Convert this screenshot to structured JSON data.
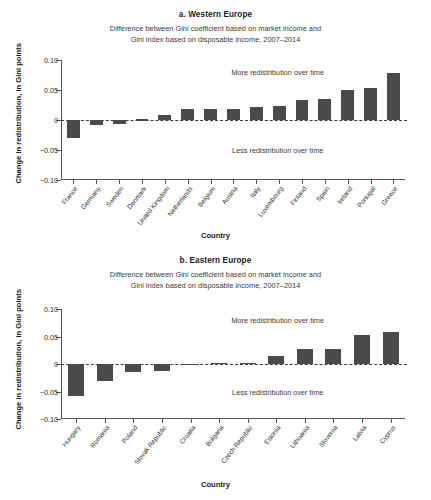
{
  "figure": {
    "background": "#ffffff",
    "bar_color": "#4a4a4a",
    "axis_color": "#555555"
  },
  "panel_a": {
    "title": "a. Western Europe",
    "subtitle_line1": "Difference between Gini coefficient based on market income and",
    "subtitle_line2": "Gini index based on disposable income, 2007–2014",
    "xlabel": "Country",
    "ylabel": "Change in redistribution, in Gini points",
    "annotation_above": "More redistribution over time",
    "annotation_below": "Less redistribution over time",
    "ytick_labels": [
      "0.10",
      "0.05",
      "0",
      "−0.05",
      "−0.10"
    ]
  },
  "panel_b": {
    "title": "b. Eastern Europe",
    "subtitle_line1": "Difference between Gini coefficient based on market income and",
    "subtitle_line2": "Gini index based on disposable income, 2007–2014",
    "xlabel": "Country",
    "ylabel": "Change in redistribution, in Gini points",
    "annotation_above": "More redistribution over time",
    "annotation_below": "Less redistribution over time",
    "ytick_labels": [
      "0.10",
      "0.05",
      "0",
      "−0.05",
      "−0.10"
    ]
  },
  "chart_data": [
    {
      "type": "bar",
      "panel": "a",
      "title": "a. Western Europe",
      "subtitle": "Difference between Gini coefficient based on market income and Gini index based on disposable income, 2007–2014",
      "xlabel": "Country",
      "ylabel": "Change in redistribution, in Gini points",
      "ylim": [
        -0.1,
        0.1
      ],
      "yticks": [
        0.1,
        0.05,
        0,
        -0.05,
        -0.1
      ],
      "grid": false,
      "legend": "none",
      "annotations": [
        "More redistribution over time",
        "Less redistribution over time"
      ],
      "categories": [
        "France",
        "Germany",
        "Sweden",
        "Denmark",
        "United Kingdom",
        "Netherlands",
        "Belgium",
        "Austria",
        "Italy",
        "Luxembourg",
        "Finland",
        "Spain",
        "Ireland",
        "Portugal",
        "Greece"
      ],
      "values": [
        -0.03,
        -0.009,
        -0.006,
        0.001,
        0.008,
        0.018,
        0.019,
        0.019,
        0.021,
        0.024,
        0.033,
        0.035,
        0.05,
        0.053,
        0.078
      ]
    },
    {
      "type": "bar",
      "panel": "b",
      "title": "b. Eastern Europe",
      "subtitle": "Difference between Gini coefficient based on market income and Gini index based on disposable income, 2007–2014",
      "xlabel": "Country",
      "ylabel": "Change in redistribution, in Gini points",
      "ylim": [
        -0.1,
        0.1
      ],
      "yticks": [
        0.1,
        0.05,
        0,
        -0.05,
        -0.1
      ],
      "grid": false,
      "legend": "none",
      "annotations": [
        "More redistribution over time",
        "Less redistribution over time"
      ],
      "categories": [
        "Hungary",
        "Romania",
        "Poland",
        "Slovak Republic",
        "Croatia",
        "Bulgaria",
        "Czech Republic",
        "Estonia",
        "Lithuania",
        "Slovenia",
        "Latvia",
        "Cyprus"
      ],
      "values": [
        -0.058,
        -0.03,
        -0.015,
        -0.013,
        -0.002,
        0.002,
        0.002,
        0.014,
        0.027,
        0.028,
        0.052,
        0.058
      ]
    }
  ]
}
